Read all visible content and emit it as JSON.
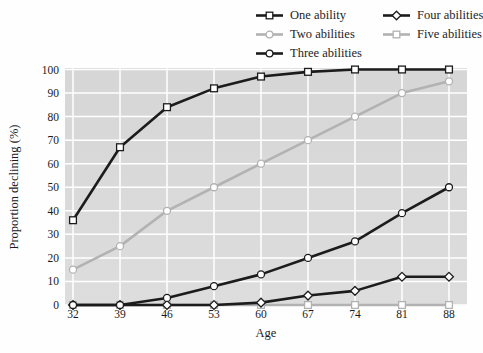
{
  "figure": {
    "y_axis_label": "Proportion declining (%)",
    "x_axis_label": "Age"
  },
  "colors": {
    "black_series": "#1c1c1c",
    "gray_series": "#b2b2b2",
    "plot_bg_top": "#d6d6d6",
    "plot_bg_bottom": "#dddddd",
    "gridline": "#ffffff",
    "marker_fill": "#ffffff",
    "text": "#1a1a1a"
  },
  "legend": {
    "columns": [
      {
        "series_indexes": [
          0,
          1,
          2
        ]
      },
      {
        "series_indexes": [
          3,
          4
        ]
      }
    ]
  },
  "chart_data": {
    "type": "line",
    "title": "",
    "xlabel": "Age",
    "ylabel": "Proportion declining (%)",
    "x": [
      32,
      39,
      46,
      53,
      60,
      67,
      74,
      81,
      88
    ],
    "ylim": [
      0,
      100
    ],
    "y_ticks": [
      0,
      10,
      20,
      30,
      40,
      50,
      60,
      70,
      80,
      90,
      100
    ],
    "grid": true,
    "legend_position": "top-right",
    "series": [
      {
        "name": "One ability",
        "marker": "square",
        "color": "black",
        "values": [
          36,
          67,
          84,
          92,
          97,
          99,
          100,
          100,
          100
        ]
      },
      {
        "name": "Two abilities",
        "marker": "circle",
        "color": "gray",
        "values": [
          15,
          25,
          40,
          50,
          60,
          70,
          80,
          90,
          95
        ]
      },
      {
        "name": "Three abilities",
        "marker": "circle",
        "color": "black",
        "values": [
          0,
          0,
          3,
          8,
          13,
          20,
          27,
          39,
          50
        ]
      },
      {
        "name": "Four abilities",
        "marker": "diamond",
        "color": "black",
        "values": [
          0,
          0,
          0,
          0,
          1,
          4,
          6,
          12,
          12
        ]
      },
      {
        "name": "Five abilities",
        "marker": "square",
        "color": "gray",
        "values": [
          0,
          0,
          0,
          0,
          0,
          0,
          0,
          0,
          0
        ]
      }
    ]
  }
}
